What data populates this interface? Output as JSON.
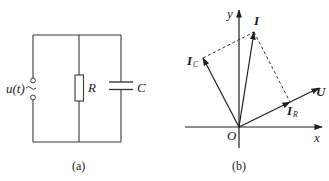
{
  "figure_a": {
    "caption": "(a)",
    "source_label": "u(t)",
    "source_symbol": "~",
    "resistor_label": "R",
    "capacitor_label": "C"
  },
  "figure_b": {
    "caption": "(b)",
    "axis_x_label": "x",
    "axis_y_label": "y",
    "origin_label": "O",
    "phasors": {
      "I": {
        "label": "I",
        "sub": ""
      },
      "IC": {
        "label": "I",
        "sub": "C"
      },
      "IR": {
        "label": "I",
        "sub": "R"
      },
      "U": {
        "label": "U",
        "sub": ""
      }
    }
  },
  "colors": {
    "line": "#1e1e1e",
    "background": "#ffffff"
  }
}
